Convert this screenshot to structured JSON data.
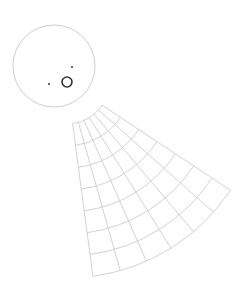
{
  "canvas": {
    "width": 248,
    "height": 286,
    "background": "#ffffff"
  },
  "colors": {
    "grid_line": "#d2d2d2",
    "head_outline": "#cfcfcf",
    "marker": "#333333",
    "dot": "#333333"
  },
  "head": {
    "cx": 54,
    "cy": 66,
    "r": 41
  },
  "mouth_marker": {
    "cx": 67,
    "cy": 82,
    "r": 5
  },
  "dots": [
    {
      "cx": 49,
      "cy": 84,
      "r": 1
    },
    {
      "cx": 72,
      "cy": 67,
      "r": 1
    }
  ],
  "fan": {
    "cx": 67,
    "cy": 82,
    "start_angle_deg": 33.5,
    "end_angle_deg": 82.4,
    "radial_lines": 7,
    "arc_radii": [
      42,
      64,
      86,
      108,
      130,
      152,
      174,
      196
    ]
  }
}
